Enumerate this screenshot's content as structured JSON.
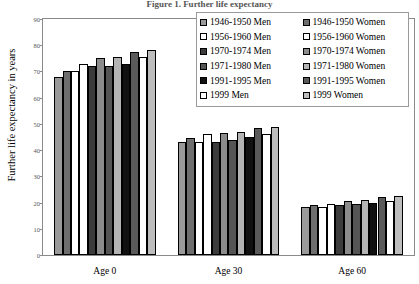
{
  "title": "Figure 1. Further life expectancy",
  "axis": {
    "ylabel": "Further life expectancy in years",
    "yticks": [
      "0",
      "10",
      "20",
      "30",
      "40",
      "50",
      "60",
      "70",
      "80",
      "90"
    ]
  },
  "legend": {
    "men": [
      {
        "label": "1946-1950 Men",
        "color": "#9a9a9a"
      },
      {
        "label": "1956-1960 Men",
        "color": "#ffffff"
      },
      {
        "label": "1970-1974 Men",
        "color": "#3c3c3c"
      },
      {
        "label": "1971-1980 Men",
        "color": "#555555"
      },
      {
        "label": "1991-1995 Men",
        "color": "#111111"
      },
      {
        "label": "1999 Men",
        "color": "#ffffff"
      }
    ],
    "women": [
      {
        "label": "1946-1950 Women",
        "color": "#6e6e6e"
      },
      {
        "label": "1956-1960 Women",
        "color": "#ffffff"
      },
      {
        "label": "1970-1974 Women",
        "color": "#8c8c8c"
      },
      {
        "label": "1971-1980 Women",
        "color": "#b4b4b4"
      },
      {
        "label": "1991-1995 Women",
        "color": "#5a5a5a"
      },
      {
        "label": "1999 Women",
        "color": "#bdbdbd"
      }
    ]
  },
  "chart_data": {
    "type": "bar",
    "title": "Figure 1. Further life expectancy",
    "xlabel": "",
    "ylabel": "Further life expectancy in years",
    "ylim": [
      0,
      90
    ],
    "ytick_step": 10,
    "grid": false,
    "legend_position": "top-right",
    "categories": [
      "Age 0",
      "Age 30",
      "Age 60"
    ],
    "series": [
      {
        "name": "1946-1950 Men",
        "color": "#9a9a9a",
        "values": [
          68,
          43,
          18.5
        ]
      },
      {
        "name": "1946-1950 Women",
        "color": "#6e6e6e",
        "values": [
          70,
          44.5,
          19
        ]
      },
      {
        "name": "1956-1960 Men",
        "color": "#ffffff",
        "values": [
          70,
          43,
          18.5
        ]
      },
      {
        "name": "1956-1960 Women",
        "color": "#ffffff",
        "values": [
          73,
          46,
          19.5
        ]
      },
      {
        "name": "1970-1974 Men",
        "color": "#3c3c3c",
        "values": [
          72,
          43,
          19
        ]
      },
      {
        "name": "1970-1974 Women",
        "color": "#8c8c8c",
        "values": [
          75,
          46.5,
          20.5
        ]
      },
      {
        "name": "1971-1980 Men",
        "color": "#555555",
        "values": [
          72,
          44,
          19.5
        ]
      },
      {
        "name": "1971-1980 Women",
        "color": "#b4b4b4",
        "values": [
          75.5,
          47,
          21
        ]
      },
      {
        "name": "1991-1995 Men",
        "color": "#111111",
        "values": [
          73,
          45,
          20
        ]
      },
      {
        "name": "1991-1995 Women",
        "color": "#5a5a5a",
        "values": [
          77.5,
          48.5,
          22
        ]
      },
      {
        "name": "1999 Men",
        "color": "#ffffff",
        "values": [
          75.5,
          46,
          20.5
        ]
      },
      {
        "name": "1999 Women",
        "color": "#bdbdbd",
        "values": [
          78,
          49,
          22.5
        ]
      }
    ]
  }
}
